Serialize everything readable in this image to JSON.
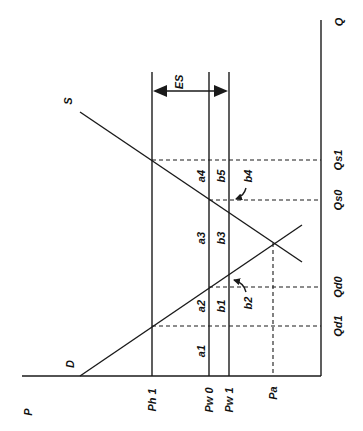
{
  "diagram": {
    "title": "",
    "orientation": "rotated-90-ccw",
    "colors": {
      "ink": "#1a1a1a",
      "background": "#ffffff"
    },
    "axes": {
      "price_axis_label": "P",
      "quantity_axis_label": "Q"
    },
    "curves": {
      "supply_label": "S",
      "demand_label": "D"
    },
    "price_levels": [
      {
        "id": "ph1",
        "label": "Ph 1",
        "style": "solid"
      },
      {
        "id": "pw0",
        "label": "Pw 0",
        "style": "solid"
      },
      {
        "id": "pw1",
        "label": "Pw 1",
        "style": "solid"
      },
      {
        "id": "pa",
        "label": "Pa",
        "style": "dashed"
      }
    ],
    "quantity_levels": [
      {
        "id": "qs1",
        "label": "Qs1"
      },
      {
        "id": "qs0",
        "label": "Qs0"
      },
      {
        "id": "qd0",
        "label": "Qd0"
      },
      {
        "id": "qd1",
        "label": "Qd1"
      }
    ],
    "areas": {
      "a1": "a1",
      "a2": "a2",
      "a3": "a3",
      "a4": "a4",
      "b1": "b1",
      "b2": "b2",
      "b3": "b3",
      "b4": "b4",
      "b5": "b5"
    },
    "annotations": {
      "es_label": "ES"
    }
  }
}
